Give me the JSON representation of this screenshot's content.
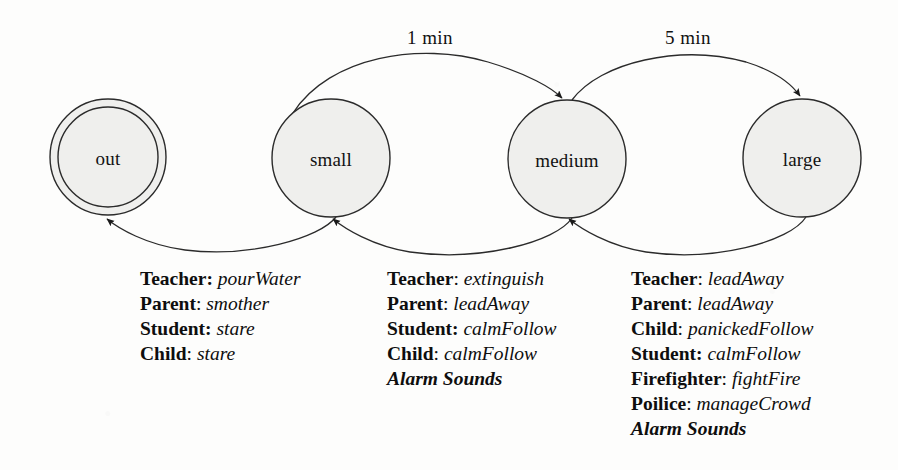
{
  "diagram": {
    "style": {
      "background": "#fdfdfc",
      "stroke": "#2b2b2b",
      "state_fill": "#efefed",
      "text": "#111111"
    },
    "states": [
      {
        "id": "out",
        "label": "out",
        "cx": 108,
        "cy": 157,
        "r": 58,
        "final": true
      },
      {
        "id": "small",
        "label": "small",
        "cx": 331,
        "cy": 158,
        "r": 59,
        "final": false
      },
      {
        "id": "medium",
        "label": "medium",
        "cx": 567,
        "cy": 159,
        "r": 59,
        "final": false
      },
      {
        "id": "large",
        "label": "large",
        "cx": 802,
        "cy": 158,
        "r": 59,
        "final": false
      }
    ],
    "transitions": [
      {
        "id": "small-to-medium",
        "from": "small",
        "to": "medium",
        "label": "1 min",
        "label_x": 430,
        "label_y": 27,
        "direction": "top"
      },
      {
        "id": "medium-to-large",
        "from": "medium",
        "to": "large",
        "label": "5 min",
        "label_x": 688,
        "label_y": 27,
        "direction": "top"
      },
      {
        "id": "small-to-out",
        "from": "small",
        "to": "out",
        "label": "",
        "direction": "bottom"
      },
      {
        "id": "medium-to-small",
        "from": "medium",
        "to": "small",
        "label": "",
        "direction": "bottom"
      },
      {
        "id": "large-to-medium",
        "from": "large",
        "to": "medium",
        "label": "",
        "direction": "bottom"
      }
    ],
    "action_blocks": [
      {
        "id": "extinguish-actions",
        "x": 140,
        "y": 266,
        "lines": [
          {
            "role": "Teacher",
            "separator": ":",
            "separator_bold": true,
            "action": "pourWater"
          },
          {
            "role": "Parent",
            "separator": ":",
            "separator_bold": false,
            "action": "smother"
          },
          {
            "role": "Student",
            "separator": ":",
            "separator_bold": true,
            "action": "stare"
          },
          {
            "role": "Child",
            "separator": ":",
            "separator_bold": false,
            "action": "stare"
          }
        ]
      },
      {
        "id": "medium-to-small-actions",
        "x": 387,
        "y": 266,
        "lines": [
          {
            "role": "Teacher",
            "separator": ":",
            "separator_bold": false,
            "action": "extinguish"
          },
          {
            "role": "Parent",
            "separator": ":",
            "separator_bold": false,
            "action": "leadAway"
          },
          {
            "role": "Student",
            "separator": ":",
            "separator_bold": true,
            "action": "calmFollow"
          },
          {
            "role": "Child",
            "separator": ":",
            "separator_bold": false,
            "action": "calmFollow"
          },
          {
            "role": "Alarm Sounds",
            "separator": "",
            "separator_bold": false,
            "action": "",
            "emphasis": true
          }
        ]
      },
      {
        "id": "large-to-medium-actions",
        "x": 631,
        "y": 266,
        "lines": [
          {
            "role": "Teacher",
            "separator": ":",
            "separator_bold": false,
            "action": "leadAway"
          },
          {
            "role": "Parent",
            "separator": ":",
            "separator_bold": false,
            "action": "leadAway"
          },
          {
            "role": "Child",
            "separator": ":",
            "separator_bold": false,
            "action": "panickedFollow"
          },
          {
            "role": "Student",
            "separator": ":",
            "separator_bold": true,
            "action": "calmFollow"
          },
          {
            "role": "Firefighter",
            "separator": ":",
            "separator_bold": false,
            "action": "fightFire"
          },
          {
            "role": "Poilice",
            "separator": ":",
            "separator_bold": false,
            "action": "manageCrowd"
          },
          {
            "role": "Alarm Sounds",
            "separator": "",
            "separator_bold": false,
            "action": "",
            "emphasis": true
          }
        ]
      }
    ]
  }
}
